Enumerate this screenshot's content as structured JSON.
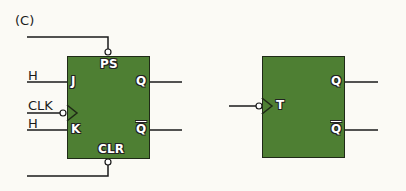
{
  "figure": {
    "panel_label": "(C)"
  },
  "jk_flipflop": {
    "inputs": {
      "preset": "PS",
      "clear": "CLR",
      "j": "J",
      "k": "K",
      "clk_pin": ""
    },
    "input_signals": {
      "j_signal": "H",
      "clk_signal": "CLK",
      "k_signal": "H"
    },
    "outputs": {
      "q": "Q",
      "q_bar": "Q"
    }
  },
  "t_flipflop": {
    "inputs": {
      "t": "T"
    },
    "outputs": {
      "q": "Q",
      "q_bar": "Q"
    }
  },
  "colors": {
    "box_fill": "#4e7f33",
    "wire": "#1a1a1a",
    "background": "#fbfaf5"
  }
}
